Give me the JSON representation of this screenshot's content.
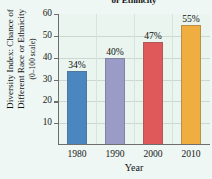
{
  "chart_data": {
    "type": "bar",
    "title": "or Ethnicity",
    "categories": [
      "1980",
      "1990",
      "2000",
      "2010"
    ],
    "values": [
      34,
      40,
      47,
      55
    ],
    "data_labels": [
      "34%",
      "40%",
      "47%",
      "55%"
    ],
    "xlabel": "Year",
    "ylabel_lines": [
      "Diversity Index: Chance of",
      "Different Race or Ethnicity",
      "(0–100 scale)"
    ],
    "ylim": [
      0,
      60
    ],
    "yticks": [
      "10",
      "20",
      "30",
      "40",
      "50",
      "60"
    ],
    "ytick_values": [
      10,
      20,
      30,
      40,
      50,
      60
    ],
    "grid": true,
    "legend": "none",
    "colors": {
      "bar_1980": "#4a86c0",
      "bar_1990": "#9b9bc8",
      "bar_2000": "#e0595a",
      "bar_2010": "#f0ad40",
      "plot_background": "#eaf5ef",
      "figure_background": "#eef7f3",
      "axis": "#6e6e6e",
      "gridline": "#c9d9d2",
      "text": "#111111"
    }
  }
}
